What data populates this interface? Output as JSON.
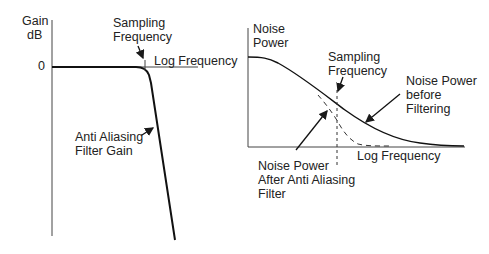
{
  "left_chart": {
    "y_axis_label_line1": "Gain",
    "y_axis_label_line2": "dB",
    "zero_tick": "0",
    "x_axis_label": "Log Frequency",
    "sampling_label_line1": "Sampling",
    "sampling_label_line2": "Frequency",
    "curve_label_line1": "Anti Aliasing",
    "curve_label_line2": "Filter Gain"
  },
  "right_chart": {
    "y_axis_label_line1": "Noise",
    "y_axis_label_line2": "Power",
    "x_axis_label": "Log Frequency",
    "sampling_label_line1": "Sampling",
    "sampling_label_line2": "Frequency",
    "before_label_line1": "Noise Power",
    "before_label_line2": "before",
    "before_label_line3": "Filtering",
    "after_label_line1": "Noise Power",
    "after_label_line2": "After Anti Aliasing",
    "after_label_line3": "Filter"
  },
  "colors": {
    "line": "#1a1a1a",
    "background": "#ffffff"
  }
}
